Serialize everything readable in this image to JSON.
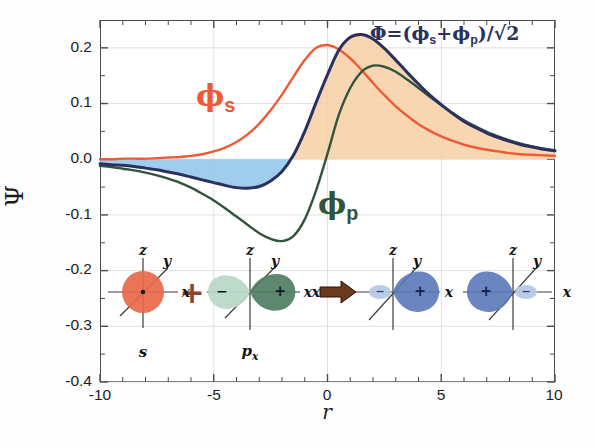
{
  "chart_data": {
    "type": "line",
    "title": "",
    "xlabel": "r",
    "ylabel": "Ψ",
    "xlim": [
      -10,
      10
    ],
    "ylim": [
      -0.4,
      0.25
    ],
    "grid": true,
    "xticks": [
      -10,
      -5,
      0,
      5,
      10
    ],
    "xtick_labels": [
      "-10",
      "-5",
      "0",
      "5",
      "10"
    ],
    "yticks": [
      0.2,
      0.1,
      0.0,
      -0.1,
      -0.2,
      -0.3,
      -0.4
    ],
    "ytick_labels": [
      "0.2",
      "0.1",
      "0.0",
      "-0.1",
      "-0.2",
      "-0.3",
      "-0.4"
    ],
    "legend_position": "inline-annotations",
    "annotations": [
      {
        "name": "phi-s-label",
        "text": "ϕ",
        "sub": "s",
        "color": "#ef5a35",
        "x": -5.2,
        "y": 0.105
      },
      {
        "name": "phi-p-label",
        "text": "ϕ",
        "sub": "p",
        "color": "#31543c",
        "x": 0.2,
        "y": -0.068
      },
      {
        "name": "hybrid-formula",
        "text": "Φ=(ϕs+ϕp)/√2",
        "color": "#2a3160",
        "x": 2.5,
        "y": 0.215
      }
    ],
    "series": [
      {
        "name": "ϕs",
        "label": "phi-s",
        "color": "#ef5a35",
        "description": "2s-like radial wavefunction, peak 0.205 near r=-0.6",
        "x": [
          -10,
          -9.5,
          -9,
          -8.5,
          -8,
          -7.5,
          -7,
          -6.5,
          -6,
          -5.5,
          -5,
          -4.5,
          -4,
          -3.5,
          -3,
          -2.5,
          -2,
          -1.5,
          -1,
          -0.5,
          0,
          0.5,
          1,
          1.5,
          2,
          2.5,
          3,
          3.5,
          4,
          4.5,
          5,
          5.5,
          6,
          6.5,
          7,
          7.5,
          8,
          8.5,
          9,
          9.5,
          10
        ],
        "y": [
          0.0,
          0.0,
          0.001,
          0.001,
          0.001,
          0.002,
          0.003,
          0.004,
          0.006,
          0.009,
          0.014,
          0.021,
          0.031,
          0.045,
          0.064,
          0.088,
          0.116,
          0.148,
          0.178,
          0.2,
          0.205,
          0.197,
          0.181,
          0.16,
          0.137,
          0.115,
          0.095,
          0.078,
          0.063,
          0.051,
          0.041,
          0.033,
          0.026,
          0.021,
          0.017,
          0.014,
          0.011,
          0.009,
          0.008,
          0.007,
          0.006
        ]
      },
      {
        "name": "ϕp",
        "label": "phi-p",
        "color": "#31543c",
        "description": "2p-like wavefunction, antisymmetric: min -0.147 at r=-2, peak 0.168 at r=2",
        "x": [
          -10,
          -9.5,
          -9,
          -8.5,
          -8,
          -7.5,
          -7,
          -6.5,
          -6,
          -5.5,
          -5,
          -4.5,
          -4,
          -3.5,
          -3,
          -2.5,
          -2,
          -1.5,
          -1,
          -0.5,
          0,
          0.5,
          1,
          1.5,
          2,
          2.5,
          3,
          3.5,
          4,
          4.5,
          5,
          5.5,
          6,
          6.5,
          7,
          7.5,
          8,
          8.5,
          9,
          9.5,
          10
        ],
        "y": [
          -0.012,
          -0.014,
          -0.017,
          -0.02,
          -0.024,
          -0.029,
          -0.035,
          -0.042,
          -0.051,
          -0.062,
          -0.074,
          -0.088,
          -0.103,
          -0.118,
          -0.133,
          -0.143,
          -0.147,
          -0.138,
          -0.108,
          -0.056,
          0.01,
          0.08,
          0.128,
          0.157,
          0.168,
          0.166,
          0.157,
          0.143,
          0.128,
          0.112,
          0.097,
          0.083,
          0.07,
          0.059,
          0.049,
          0.041,
          0.034,
          0.028,
          0.023,
          0.019,
          0.016
        ]
      },
      {
        "name": "Φ",
        "label": "hybrid-sp",
        "color": "#2a3160",
        "description": "sp hybrid = (phi_s + phi_p)/sqrt(2); min -0.046 near r=-2.6, peak 0.222 at r=1.1",
        "x": [
          -10,
          -9.5,
          -9,
          -8.5,
          -8,
          -7.5,
          -7,
          -6.5,
          -6,
          -5.5,
          -5,
          -4.5,
          -4,
          -3.5,
          -3,
          -2.5,
          -2,
          -1.5,
          -1,
          -0.5,
          0,
          0.5,
          1,
          1.5,
          2,
          2.5,
          3,
          3.5,
          4,
          4.5,
          5,
          5.5,
          6,
          6.5,
          7,
          7.5,
          8,
          8.5,
          9,
          9.5,
          10
        ],
        "y": [
          -0.008,
          -0.01,
          -0.011,
          -0.013,
          -0.016,
          -0.019,
          -0.023,
          -0.027,
          -0.032,
          -0.037,
          -0.042,
          -0.047,
          -0.051,
          -0.052,
          -0.049,
          -0.039,
          -0.022,
          0.007,
          0.05,
          0.102,
          0.152,
          0.196,
          0.219,
          0.224,
          0.216,
          0.199,
          0.178,
          0.156,
          0.135,
          0.115,
          0.098,
          0.082,
          0.068,
          0.057,
          0.047,
          0.039,
          0.032,
          0.026,
          0.022,
          0.018,
          0.015
        ]
      }
    ],
    "shaded_regions": [
      {
        "name": "negative-lobe-fill",
        "color": "#8ec4e8",
        "between": "hybrid-sp and zero",
        "range": [
          -10,
          -1.6
        ]
      },
      {
        "name": "positive-lobe-fill",
        "color": "#f8cfa4",
        "between": "hybrid-sp and zero",
        "range": [
          -1.6,
          10
        ]
      }
    ]
  },
  "orbital_diagram": {
    "name": "sp-hybridization-diagram",
    "items": [
      {
        "name": "s-orbital",
        "label": "s",
        "color": "#e8684a",
        "axis_labels": [
          "z",
          "y",
          "x"
        ],
        "signs": []
      },
      {
        "name": "plus-operator",
        "label": "+",
        "color": "#8a4530"
      },
      {
        "name": "px-orbital",
        "label": "p",
        "sub": "x",
        "color_positive": "#4f7d63",
        "color_negative": "#b9d8c8",
        "axis_labels": [
          "z",
          "y",
          "x"
        ],
        "signs": [
          "−",
          "+"
        ]
      },
      {
        "name": "arrow-operator",
        "label": "→",
        "color": "#6b3a1d"
      },
      {
        "name": "sp-hybrid-forward",
        "label": "",
        "color_positive": "#5a78b8",
        "color_negative": "#b6c9e6",
        "axis_labels": [
          "z",
          "y",
          "x"
        ],
        "signs": [
          "−",
          "+"
        ]
      },
      {
        "name": "sp-hybrid-reverse",
        "label": "",
        "color_positive": "#5a78b8",
        "color_negative": "#b6c9e6",
        "axis_labels": [
          "z",
          "y",
          "x"
        ],
        "signs": [
          "+",
          "−"
        ]
      }
    ]
  },
  "labels": {
    "phi_s_base": "ϕ",
    "phi_s_sub": "s",
    "phi_p_base": "ϕ",
    "phi_p_sub": "p",
    "formula_prefix": "Φ=(ϕ",
    "formula_sub1": "s",
    "formula_mid": "+ϕ",
    "formula_sub2": "p",
    "formula_suffix": ")/√2",
    "y_axis": "Ψ",
    "x_axis": "r",
    "s_symbol": "s",
    "p_symbol": "p",
    "p_sub": "x",
    "axis_z": "z",
    "axis_y": "y",
    "axis_x": "x",
    "sign_plus": "+",
    "sign_minus": "−",
    "operator_plus": "+"
  }
}
